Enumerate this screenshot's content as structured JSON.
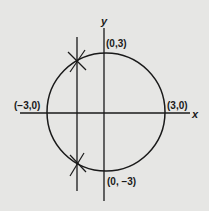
{
  "diagram": {
    "type": "coordinate-plane-circle",
    "background": "#e6e6e4",
    "stroke_color": "#1a1a1a",
    "axes": {
      "x_label": "x",
      "y_label": "y"
    },
    "circle": {
      "center": "(0,0)",
      "radius": 3
    },
    "points": {
      "top": "(0,3)",
      "bottom": "(0, −3)",
      "left": "(−3,0)",
      "right": "(3,0)"
    },
    "vertical_line": {
      "description": "vertical line crossing circle left of y-axis, intersections marked with X"
    }
  }
}
